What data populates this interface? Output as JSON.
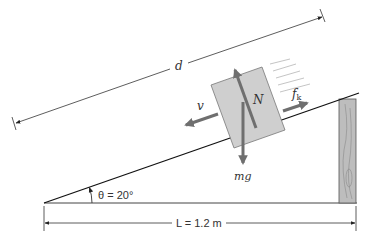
{
  "figure": {
    "labels": {
      "d": "d",
      "v": "v",
      "N": "N",
      "fk_main": "f",
      "fk_sub": "k",
      "mg": "mg",
      "theta": "θ = 20°",
      "L": "L = 1.2 m"
    },
    "values": {
      "incline_angle_deg": 20,
      "base_length_m": 1.2
    },
    "colors": {
      "line": "#222222",
      "block_fill": "#cfcfcf",
      "block_stroke": "#777777",
      "vector": "#6f6f6f",
      "post_fill": "#b9b9b9",
      "motion_lines": "#aaaaaa"
    }
  }
}
